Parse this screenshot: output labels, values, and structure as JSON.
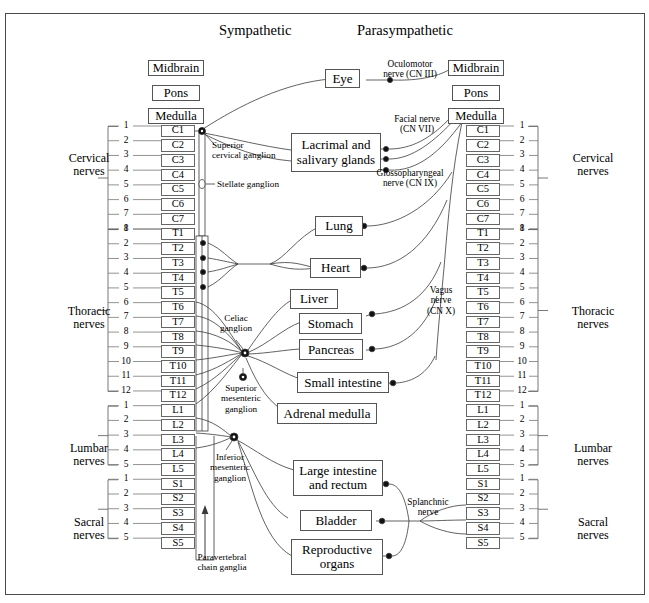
{
  "figure": {
    "title_left": "Sympathetic",
    "title_right": "Parasympathetic"
  },
  "sympathetic": {
    "brain": [
      {
        "label": "Midbrain"
      },
      {
        "label": "Pons"
      },
      {
        "label": "Medulla"
      }
    ],
    "cord_segments": [
      "C1",
      "C2",
      "C3",
      "C4",
      "C5",
      "C6",
      "C7",
      "T1",
      "T2",
      "T3",
      "T4",
      "T5",
      "T6",
      "T7",
      "T8",
      "T9",
      "T10",
      "T11",
      "T12",
      "L1",
      "L2",
      "L3",
      "L4",
      "L5",
      "S1",
      "S2",
      "S3",
      "S4",
      "S5"
    ],
    "groups": [
      {
        "name": "Cervical nerves",
        "line1": "Cervical",
        "line2": "nerves",
        "numbers": [
          "1",
          "2",
          "3",
          "4",
          "5",
          "6",
          "7",
          "8"
        ]
      },
      {
        "name": "Thoracic nerves",
        "line1": "Thoracic",
        "line2": "nerves",
        "numbers": [
          "1",
          "2",
          "3",
          "4",
          "5",
          "6",
          "7",
          "8",
          "9",
          "10",
          "11",
          "12"
        ]
      },
      {
        "name": "Lumbar nerves",
        "line1": "Lumbar",
        "line2": "nerves",
        "numbers": [
          "1",
          "2",
          "3",
          "4",
          "5"
        ]
      },
      {
        "name": "Sacral nerves",
        "line1": "Sacral",
        "line2": "nerves",
        "numbers": [
          "1",
          "2",
          "3",
          "4",
          "5"
        ]
      }
    ],
    "ganglia": [
      {
        "id": "superior-cervical-ganglion",
        "line1": "Superior",
        "line2": "cervical ganglion"
      },
      {
        "id": "stellate-ganglion",
        "line1": "Stellate ganglion",
        "line2": ""
      },
      {
        "id": "celiac-ganglion",
        "line1": "Celiac",
        "line2": "ganglion"
      },
      {
        "id": "superior-mesenteric-ganglion",
        "line1": "Superior",
        "line2": "mesenteric",
        "line3": "ganglion"
      },
      {
        "id": "inferior-mesenteric-ganglion",
        "line1": "Inferior",
        "line2": "mesenteric",
        "line3": "ganglion"
      },
      {
        "id": "paravertebral-chain-ganglia",
        "line1": "Paravertebral",
        "line2": "chain ganglia"
      }
    ]
  },
  "parasympathetic": {
    "brain": [
      {
        "label": "Midbrain"
      },
      {
        "label": "Pons"
      },
      {
        "label": "Medulla"
      }
    ],
    "cord_segments": [
      "C1",
      "C2",
      "C3",
      "C4",
      "C5",
      "C6",
      "C7",
      "T1",
      "T2",
      "T3",
      "T4",
      "T5",
      "T6",
      "T7",
      "T8",
      "T9",
      "T10",
      "T11",
      "T12",
      "L1",
      "L2",
      "L3",
      "L4",
      "L5",
      "S1",
      "S2",
      "S3",
      "S4",
      "S5"
    ],
    "groups": [
      {
        "name": "Cervical nerves",
        "line1": "Cervical",
        "line2": "nerves",
        "numbers": [
          "1",
          "2",
          "3",
          "4",
          "5",
          "6",
          "7",
          "8"
        ]
      },
      {
        "name": "Thoracic nerves",
        "line1": "Thoracic",
        "line2": "nerves",
        "numbers": [
          "1",
          "2",
          "3",
          "4",
          "5",
          "6",
          "7",
          "8",
          "9",
          "10",
          "11",
          "12"
        ]
      },
      {
        "name": "Lumbar nerves",
        "line1": "Lumbar",
        "line2": "nerves",
        "numbers": [
          "1",
          "2",
          "3",
          "4",
          "5"
        ]
      },
      {
        "name": "Sacral nerves",
        "line1": "Sacral",
        "line2": "nerves",
        "numbers": [
          "1",
          "2",
          "3",
          "4",
          "5"
        ]
      }
    ],
    "nerves": [
      {
        "id": "oculomotor-nerve",
        "line1": "Oculomotor",
        "line2": "nerve (CN III)"
      },
      {
        "id": "facial-nerve",
        "line1": "Facial nerve",
        "line2": "(CN VII)"
      },
      {
        "id": "glossopharyngeal-nerve",
        "line1": "Glossopharyngeal",
        "line2": "nerve (CN IX)"
      },
      {
        "id": "vagus-nerve",
        "line1": "Vagus",
        "line2": "nerve",
        "line3": "(CN X)"
      },
      {
        "id": "splanchnic-nerve",
        "line1": "Splanchnic",
        "line2": "nerve"
      }
    ]
  },
  "organs": [
    {
      "id": "eye",
      "line1": "Eye",
      "line2": ""
    },
    {
      "id": "lacrimal-and-salivary-glands",
      "line1": "Lacrimal and",
      "line2": "salivary glands"
    },
    {
      "id": "lung",
      "line1": "Lung",
      "line2": ""
    },
    {
      "id": "heart",
      "line1": "Heart",
      "line2": ""
    },
    {
      "id": "liver",
      "line1": "Liver",
      "line2": ""
    },
    {
      "id": "stomach",
      "line1": "Stomach",
      "line2": ""
    },
    {
      "id": "pancreas",
      "line1": "Pancreas",
      "line2": ""
    },
    {
      "id": "small-intestine",
      "line1": "Small intestine",
      "line2": ""
    },
    {
      "id": "adrenal-medulla",
      "line1": "Adrenal medulla",
      "line2": ""
    },
    {
      "id": "large-intestine-and-rectum",
      "line1": "Large intestine",
      "line2": "and rectum"
    },
    {
      "id": "bladder",
      "line1": "Bladder",
      "line2": ""
    },
    {
      "id": "reproductive-organs",
      "line1": "Reproductive",
      "line2": "organs"
    }
  ],
  "colors": {
    "stroke": "#3a3a3a",
    "frame": "#4a4a4a",
    "text": "#000000",
    "background": "#ffffff"
  }
}
